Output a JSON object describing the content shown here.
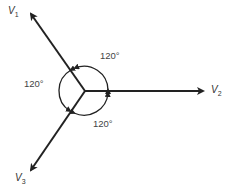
{
  "diagram": {
    "type": "three-phase phasor diagram",
    "center": [
      85,
      91
    ],
    "vectors": [
      {
        "name": "V",
        "subscript": "1",
        "tip": [
          30,
          12
        ]
      },
      {
        "name": "V",
        "subscript": "2",
        "tip": [
          205,
          91
        ]
      },
      {
        "name": "V",
        "subscript": "3",
        "tip": [
          29,
          172
        ]
      }
    ],
    "angles": [
      {
        "label": "120°",
        "between": [
          "V1",
          "V2"
        ]
      },
      {
        "label": "120°",
        "between": [
          "V1",
          "V3"
        ]
      },
      {
        "label": "120°",
        "between": [
          "V2",
          "V3"
        ]
      }
    ],
    "colors": {
      "line": "#222222",
      "text": "#333333"
    }
  }
}
